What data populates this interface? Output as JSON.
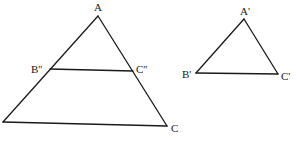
{
  "diagram": {
    "title": "",
    "figures": [
      {
        "id": "large-triangle",
        "vertices": [
          "A",
          "B",
          "C"
        ],
        "segment": [
          "B''",
          "C''"
        ],
        "labels": {
          "A": "A",
          "C": "C",
          "B2": "B''",
          "C2": "C''"
        }
      },
      {
        "id": "small-triangle",
        "vertices": [
          "A'",
          "B'",
          "C'"
        ],
        "labels": {
          "A1": "A'",
          "B1": "B'",
          "C1": "C'"
        }
      }
    ]
  }
}
